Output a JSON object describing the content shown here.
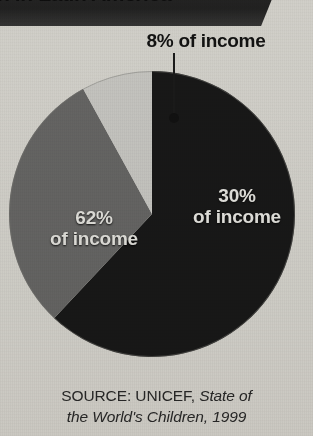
{
  "banner": {
    "title": "n in Latin America",
    "bar_color": "#252525",
    "text_color": "#f2f2f0"
  },
  "source": {
    "prefix": "SOURCE: UNICEF, ",
    "publication": "State of",
    "publication_line2": "the World's Children, 1999"
  },
  "palette": {
    "background": "#e4e3df",
    "slice_dark": "#1a1a1a",
    "slice_medium": "#6e6e6e",
    "slice_light": "#d6d6d4",
    "leader_line": "#1d1d1d",
    "label_light": "#f5f5f3",
    "label_dark": "#141414"
  },
  "callout": {
    "label": "8% of income",
    "leader_from_y": 53,
    "leader_to_y": 118,
    "leader_x": 174
  },
  "chart_data": {
    "type": "pie",
    "title": "n in Latin America",
    "xlabel": "",
    "ylabel": "",
    "unit": "percent of income",
    "total": 100,
    "legend": "none (labels drawn on slices)",
    "grid": false,
    "source": "SOURCE: UNICEF, State of the World's Children, 1999",
    "categories": [
      "62% of income",
      "30% of income",
      "8% of income"
    ],
    "values": [
      62,
      30,
      8
    ],
    "slices": [
      {
        "label": "62%\nof income",
        "value": 62,
        "percent": 62,
        "color": "#1a1a1a",
        "label_color": "#f4f4f2",
        "label_position": "inside-left",
        "start_angle_deg": 0,
        "end_angle_deg": 223.2
      },
      {
        "label": "30%\nof income",
        "value": 30,
        "percent": 30,
        "color": "#6e6e6e",
        "label_color": "#f7f7f5",
        "label_position": "inside-right",
        "start_angle_deg": 223.2,
        "end_angle_deg": 331.2
      },
      {
        "label": "8% of income",
        "value": 8,
        "percent": 8,
        "color": "#d6d6d4",
        "label_color": "#141414",
        "label_position": "callout-above",
        "start_angle_deg": 331.2,
        "end_angle_deg": 360
      }
    ],
    "geometry": {
      "center_x": 152,
      "center_y": 214,
      "radius": 143,
      "start_at_top": true,
      "direction": "clockwise"
    }
  }
}
